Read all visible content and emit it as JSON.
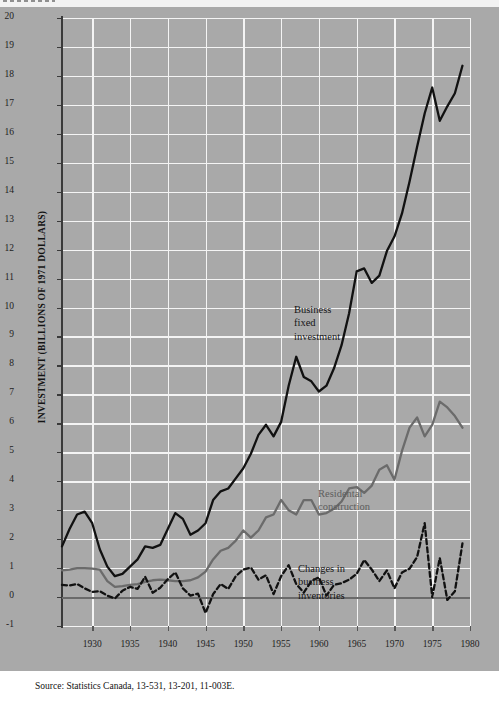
{
  "page": {
    "source_note": "Source:  Statistics Canada, 13-531, 13-201, 11-003E.",
    "background_color": "#a9a9a9",
    "grid_color": "#f4f4f4"
  },
  "chart_data": {
    "type": "line",
    "title": "",
    "xlabel": "",
    "ylabel": "INVESTMENT (BILLIONS OF 1971 DOLLARS)",
    "xlim": [
      1926,
      1980
    ],
    "ylim": [
      -1,
      20
    ],
    "grid": true,
    "legend": "inline-annotations",
    "xticks": [
      1930,
      1935,
      1940,
      1945,
      1950,
      1955,
      1960,
      1965,
      1970,
      1975,
      1980
    ],
    "yticks": [
      -1,
      0,
      1,
      2,
      3,
      4,
      5,
      6,
      7,
      8,
      9,
      10,
      11,
      12,
      13,
      14,
      15,
      16,
      17,
      18,
      19,
      20
    ],
    "annotations": [
      {
        "name": "business-fixed-investment-label",
        "text": "Business\nfixed\ninvestment",
        "color": "#151515"
      },
      {
        "name": "residential-construction-label",
        "text": "Residental\nconstruction",
        "color": "#5d5d5d"
      },
      {
        "name": "changes-in-business-inventories-label",
        "text": "Changes in\nbusiness\ninventories",
        "color": "#151515"
      }
    ],
    "x": [
      1926,
      1927,
      1928,
      1929,
      1930,
      1931,
      1932,
      1933,
      1934,
      1935,
      1936,
      1937,
      1938,
      1939,
      1940,
      1941,
      1942,
      1943,
      1944,
      1945,
      1946,
      1947,
      1948,
      1949,
      1950,
      1951,
      1952,
      1953,
      1954,
      1955,
      1956,
      1957,
      1958,
      1959,
      1960,
      1961,
      1962,
      1963,
      1964,
      1965,
      1966,
      1967,
      1968,
      1969,
      1970,
      1971,
      1972,
      1973,
      1974,
      1975,
      1976,
      1977,
      1978,
      1979
    ],
    "series": [
      {
        "name": "Business fixed investment",
        "style": "solid",
        "color": "#111111",
        "width": 2.3,
        "values": [
          1.75,
          2.35,
          2.85,
          2.95,
          2.55,
          1.65,
          1.05,
          0.72,
          0.8,
          1.05,
          1.3,
          1.75,
          1.7,
          1.8,
          2.35,
          2.9,
          2.7,
          2.15,
          2.3,
          2.55,
          3.35,
          3.65,
          3.75,
          4.1,
          4.45,
          4.95,
          5.6,
          5.95,
          5.55,
          6.05,
          7.3,
          8.3,
          7.6,
          7.45,
          7.1,
          7.3,
          7.9,
          8.7,
          9.8,
          11.25,
          11.35,
          10.85,
          11.1,
          11.95,
          12.45,
          13.25,
          14.35,
          15.55,
          16.7,
          17.6,
          16.45,
          16.95,
          17.4,
          18.35
        ]
      },
      {
        "name": "Residential construction",
        "style": "solid",
        "color": "#6b6b6b",
        "width": 2.3,
        "values": [
          0.92,
          0.95,
          1.0,
          1.0,
          0.98,
          0.95,
          0.55,
          0.35,
          0.38,
          0.42,
          0.45,
          0.52,
          0.58,
          0.6,
          0.58,
          0.55,
          0.55,
          0.58,
          0.68,
          0.88,
          1.3,
          1.6,
          1.7,
          1.95,
          2.3,
          2.05,
          2.3,
          2.75,
          2.85,
          3.35,
          3.0,
          2.85,
          3.35,
          3.35,
          2.85,
          2.9,
          3.05,
          3.3,
          3.75,
          3.8,
          3.6,
          3.85,
          4.4,
          4.55,
          4.05,
          5.05,
          5.85,
          6.2,
          5.55,
          5.95,
          6.75,
          6.55,
          6.25,
          5.85
        ]
      },
      {
        "name": "Changes in business inventories",
        "style": "dashed",
        "color": "#111111",
        "width": 2.3,
        "values": [
          0.42,
          0.4,
          0.45,
          0.3,
          0.18,
          0.2,
          0.05,
          -0.05,
          0.22,
          0.35,
          0.28,
          0.7,
          0.15,
          0.32,
          0.62,
          0.85,
          0.3,
          0.05,
          0.12,
          -0.55,
          0.1,
          0.45,
          0.28,
          0.72,
          0.95,
          1.02,
          0.6,
          0.75,
          0.1,
          0.72,
          1.1,
          0.45,
          0.15,
          0.55,
          0.68,
          0.05,
          0.42,
          0.48,
          0.6,
          0.8,
          1.28,
          0.95,
          0.55,
          0.92,
          0.3,
          0.85,
          0.98,
          1.38,
          2.55,
          0.0,
          1.35,
          -0.1,
          0.2,
          1.85
        ]
      }
    ]
  }
}
